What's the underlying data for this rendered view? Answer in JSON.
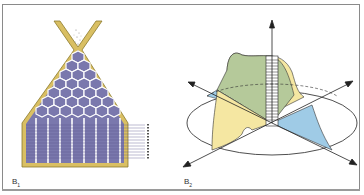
{
  "figure": {
    "panels": [
      {
        "id": "B1",
        "label_main": "B",
        "label_sub": "1",
        "description": "Cross-section of a hopper packed with hexagonal cells above columns of striated rectangular cells, with stream of particles entering at top",
        "tick_count": 12
      },
      {
        "id": "B2",
        "label_main": "B",
        "label_sub": "2",
        "description": "3D surface over an ellipse with four diagonal axes and a vertical axis, with hatched vertical slab at center"
      }
    ],
    "colors": {
      "frame": "#8a8a8a",
      "hopper_wall": "#d9bf63",
      "hopper_wall_stroke": "#8c7a2c",
      "cell_fill": "#7a78ad",
      "cell_stroke": "#ffffff",
      "surface_green": "#b5c99a",
      "surface_yellow": "#f5e7a2",
      "surface_blue": "#9fcbe6",
      "axis": "#222222"
    }
  }
}
